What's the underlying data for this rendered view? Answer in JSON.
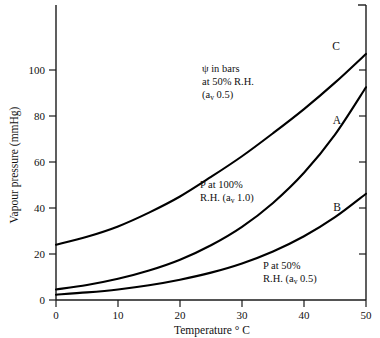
{
  "chart_data": {
    "type": "line",
    "title": "",
    "xlabel": "Temperature ° C",
    "ylabel": "Vapour pressure (mmHg)",
    "xlim": [
      0,
      50
    ],
    "ylim": [
      0,
      115
    ],
    "grid": false,
    "legend_position": "inline-annotations",
    "x_ticks": [
      "0",
      "10",
      "20",
      "30",
      "40",
      "50"
    ],
    "x_tick_values": [
      0,
      10,
      20,
      30,
      40,
      50
    ],
    "y_ticks": [
      "0",
      "20",
      "40",
      "60",
      "80",
      "100"
    ],
    "y_tick_values": [
      0,
      20,
      40,
      60,
      80,
      100
    ],
    "x": [
      0,
      5,
      10,
      15,
      20,
      25,
      30,
      35,
      40,
      45,
      50
    ],
    "series": [
      {
        "name": "A",
        "label": "A",
        "description": "P at 100% R.H. (av 1.0)",
        "values": [
          4.6,
          6.5,
          9.2,
          12.8,
          17.5,
          23.8,
          31.8,
          42.2,
          55.3,
          71.9,
          92.5
        ]
      },
      {
        "name": "B",
        "label": "B",
        "description": "P at 50% R.H. (av 0.5)",
        "values": [
          2.3,
          3.3,
          4.6,
          6.4,
          8.8,
          11.9,
          15.9,
          21.1,
          27.7,
          36.0,
          46.2
        ]
      },
      {
        "name": "C",
        "label": "C",
        "description": "psi in bars at 50% R.H. (av 0.5)",
        "values": [
          24.0,
          27.5,
          32.0,
          38.0,
          45.0,
          53.5,
          62.5,
          72.5,
          83.0,
          94.5,
          107.0
        ]
      }
    ],
    "annotations": [
      {
        "id": "annotation-psi",
        "lines": [
          "ψ in bars",
          "at 50% R.H.",
          "(a",
          "v",
          " 0.5)"
        ],
        "line1": "ψ in bars",
        "line2": "at 50% R.H.",
        "line3_pre": "(a",
        "line3_sub": "v",
        "line3_post": " 0.5)",
        "refers_to": "C"
      },
      {
        "id": "annotation-p100",
        "line1": "P at 100%",
        "line2_pre": "R.H. (a",
        "line2_sub": "v",
        "line2_post": " 1.0)",
        "refers_to": "A"
      },
      {
        "id": "annotation-p50",
        "line1": "P at 50%",
        "line2_pre": "R.H. (a",
        "line2_sub": "v",
        "line2_post": " 0.5)",
        "refers_to": "B"
      }
    ],
    "curve_labels": [
      "C",
      "A",
      "B"
    ],
    "colors": {
      "background": "#ffffff",
      "axis": "#1a1a1a",
      "curve": "#000000",
      "text": "#111111"
    }
  },
  "axes": {
    "x_title": "Temperature ° C",
    "y_title": "Vapour pressure (mmHg)"
  },
  "ticks": {
    "x": [
      "0",
      "10",
      "20",
      "30",
      "40",
      "50"
    ],
    "y": [
      "0",
      "20",
      "40",
      "60",
      "80",
      "100"
    ]
  },
  "labels": {
    "curve_a": "A",
    "curve_b": "B",
    "curve_c": "C"
  },
  "annotations": {
    "psi_line1": "ψ in bars",
    "psi_line2": "at 50% R.H.",
    "psi_line3_pre": "(a",
    "psi_line3_sub": "v",
    "psi_line3_post": " 0.5)",
    "p100_line1": "P at 100%",
    "p100_line2_pre": "R.H. (a",
    "p100_line2_sub": "v",
    "p100_line2_post": " 1.0)",
    "p50_line1": "P at 50%",
    "p50_line2_pre": "R.H. (a",
    "p50_line2_sub": "v",
    "p50_line2_post": " 0.5)"
  }
}
